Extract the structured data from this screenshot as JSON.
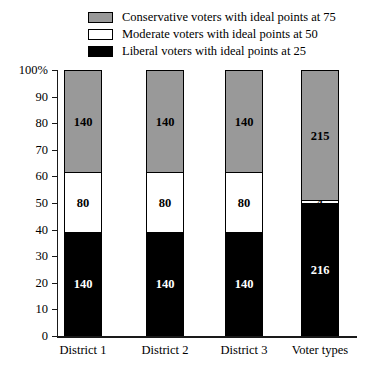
{
  "chart_data": {
    "type": "bar",
    "stacked": true,
    "title": "",
    "xlabel": "",
    "ylabel": "",
    "ylim": [
      0,
      100
    ],
    "ytick_values": [
      0,
      10,
      20,
      30,
      40,
      50,
      60,
      70,
      80,
      90,
      100
    ],
    "ytick_labels": [
      "0",
      "10",
      "20",
      "30",
      "40",
      "50",
      "60",
      "70",
      "80",
      "90",
      "100%"
    ],
    "grid": false,
    "legend_position": "top-center",
    "categories": [
      "District 1",
      "District 2",
      "District 3",
      "Voter types"
    ],
    "series": [
      {
        "name": "Conservative voters with ideal points at 75",
        "color": "#999999",
        "values": [
          140,
          140,
          140,
          215
        ],
        "percents": [
          38.9,
          38.9,
          38.9,
          49.4
        ]
      },
      {
        "name": "Moderate voters with ideal points at 50",
        "color": "#ffffff",
        "values": [
          80,
          80,
          80,
          4
        ],
        "percents": [
          22.2,
          22.2,
          22.2,
          0.9
        ]
      },
      {
        "name": "Liberal voters with ideal points at 25",
        "color": "#000000",
        "values": [
          140,
          140,
          140,
          216
        ],
        "percents": [
          38.9,
          38.9,
          38.9,
          49.7
        ]
      }
    ]
  },
  "legend": {
    "items": [
      {
        "label": "Conservative voters with ideal points at 75",
        "swatch": "conservative"
      },
      {
        "label": "Moderate voters with ideal points at 50",
        "swatch": "moderate"
      },
      {
        "label": "Liberal voters with ideal points at 25",
        "swatch": "liberal"
      }
    ]
  }
}
